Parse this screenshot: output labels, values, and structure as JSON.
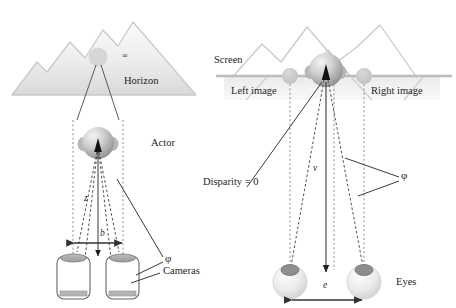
{
  "figure": {
    "panels": [
      {
        "id": "capture",
        "name": "Left panel - camera capture geometry",
        "labels": {
          "infinity": "∞",
          "horizon": "Horizon",
          "actor": "Actor",
          "distance_z": "z",
          "baseline_b": "b",
          "angle_phi": "φ",
          "cameras": "Cameras"
        }
      },
      {
        "id": "display",
        "name": "Right panel - screen viewing geometry",
        "labels": {
          "screen": "Screen",
          "left_image": "Left image",
          "right_image": "Right image",
          "disparity": "Disparity = 0",
          "viewing_distance_v": "v",
          "angle_phi": "φ",
          "eye_separation_e": "e",
          "eyes": "Eyes"
        }
      }
    ],
    "colors": {
      "mountain_fill_top": "#f2f2f2",
      "mountain_fill_bottom": "#dcdcdc",
      "mountain_stroke": "#c9c9c9",
      "sphere_light": "#f0f0f0",
      "sphere_mid": "#c4c4c4",
      "sphere_dark": "#9a9a9a",
      "ghost_circle": "#c8c8c8",
      "screen_line": "#bdbdbd",
      "leader_line": "#3a3a3a",
      "dashed_ray": "#555555",
      "text": "#231f20"
    },
    "icons": {
      "camera": "camera-icon",
      "eye": "eye-icon",
      "sphere": "sphere-icon",
      "mountain": "mountain-icon",
      "arrow_double": "double-arrow-icon",
      "arrow_down": "down-arrow-icon"
    }
  }
}
